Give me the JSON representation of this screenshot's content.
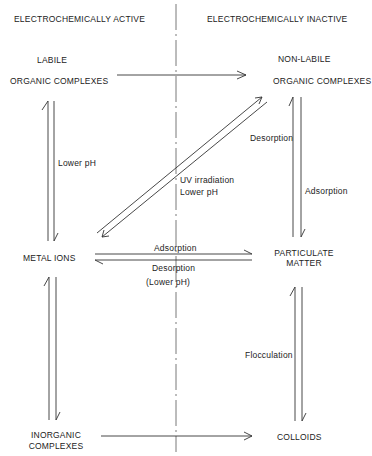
{
  "headers": {
    "left": "ELECTROCHEMICALLY ACTIVE",
    "right": "ELECTROCHEMICALLY INACTIVE"
  },
  "nodes": {
    "labile_line1": "LABILE",
    "labile_line2": "ORGANIC COMPLEXES",
    "nonlabile_line1": "NON-LABILE",
    "nonlabile_line2": "ORGANIC COMPLEXES",
    "metal_ions": "METAL IONS",
    "particulate_line1": "PARTICULATE",
    "particulate_line2": "MATTER",
    "inorganic_line1": "INORGANIC",
    "inorganic_line2": "COMPLEXES",
    "colloids": "COLLOIDS"
  },
  "edge_labels": {
    "lower_ph_left": "Lower pH",
    "uv_line1": "UV irradiation",
    "uv_line2": "Lower pH",
    "desorption_right": "Desorption",
    "adsorption_right": "Adsorption",
    "adsorption_mid": "Adsorption",
    "desorption_mid": "Desorption",
    "lower_ph_mid": "(Lower pH)",
    "flocculation": "Flocculation"
  },
  "colors": {
    "line": "#333333",
    "text": "#222222",
    "background": "#ffffff"
  }
}
